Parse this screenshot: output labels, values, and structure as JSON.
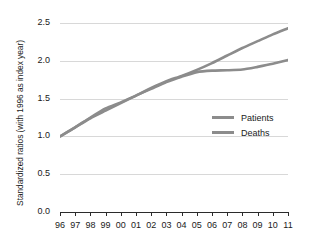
{
  "chart_data": {
    "type": "line",
    "title": "",
    "xlabel": "",
    "ylabel": "Standardized ratios (with 1996 as index year)",
    "x": [
      "96",
      "97",
      "98",
      "99",
      "00",
      "01",
      "02",
      "03",
      "04",
      "05",
      "06",
      "07",
      "08",
      "09",
      "10",
      "11"
    ],
    "xtick_labels": [
      "96",
      "97",
      "98",
      "99",
      "00",
      "01",
      "02",
      "03",
      "04",
      "05",
      "06",
      "07",
      "08",
      "09",
      "10",
      "11"
    ],
    "ytick_labels": [
      "0.0",
      "0.5",
      "1.0",
      "1.5",
      "2.0",
      "2.5"
    ],
    "ytick_values": [
      0.0,
      0.5,
      1.0,
      1.5,
      2.0,
      2.5
    ],
    "ylim": [
      0.0,
      2.5
    ],
    "grid": true,
    "legend_position": "center-right",
    "series": [
      {
        "name": "Patients",
        "color": "#8c8c8c",
        "values": [
          1.0,
          1.12,
          1.24,
          1.34,
          1.44,
          1.54,
          1.64,
          1.73,
          1.8,
          1.88,
          1.97,
          2.07,
          2.17,
          2.26,
          2.35,
          2.43
        ]
      },
      {
        "name": "Deaths",
        "color": "#8c8c8c",
        "values": [
          1.0,
          1.12,
          1.25,
          1.37,
          1.45,
          1.54,
          1.63,
          1.72,
          1.79,
          1.85,
          1.87,
          1.875,
          1.885,
          1.92,
          1.96,
          2.01
        ]
      }
    ]
  },
  "legend": {
    "items": [
      {
        "label": "Patients"
      },
      {
        "label": "Deaths"
      }
    ]
  },
  "colors": {
    "line": "#8c8c8c",
    "grid": "#d8d8d8",
    "axis": "#2b2b2b",
    "text": "#1a1a1a",
    "background": "#ffffff"
  }
}
